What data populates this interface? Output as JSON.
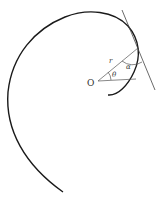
{
  "diagram": {
    "type": "polar-curve-tangent-angle",
    "labels": {
      "origin": "O",
      "radius": "r",
      "polar_angle": "θ",
      "tangent_angle": "α"
    },
    "colors": {
      "curve": "#1a1a1a",
      "lines": "#444444",
      "text": "#333333",
      "background": "#ffffff"
    }
  }
}
